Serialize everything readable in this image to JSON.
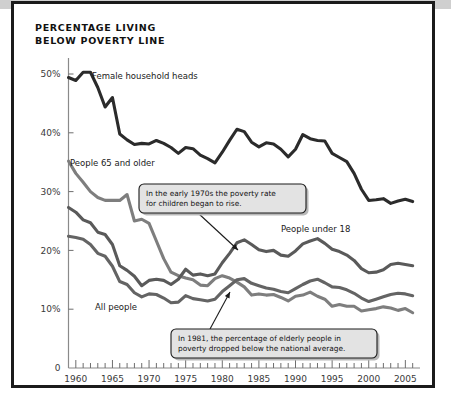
{
  "page": {
    "title_line1": "PERCENTAGE LIVING",
    "title_line2": "BELOW POVERTY LINE",
    "title": "PERCENTAGE LIVING\nBELOW POVERTY LINE",
    "frame_color": "#1b1b1b",
    "background": "#ffffff"
  },
  "chart_data": {
    "type": "line",
    "title": "PERCENTAGE LIVING BELOW POVERTY LINE",
    "xlabel": "",
    "ylabel": "",
    "xlim": [
      1959,
      2007
    ],
    "ylim": [
      0,
      53
    ],
    "grid": false,
    "legend": "inline-labels",
    "ytick_labels": [
      "0",
      "10%",
      "20%",
      "30%",
      "40%",
      "50%"
    ],
    "ytick_values": [
      0,
      10,
      20,
      30,
      40,
      50
    ],
    "xtick_labels": [
      "1960",
      "1965",
      "1970",
      "1975",
      "1980",
      "1985",
      "1990",
      "1995",
      "2000",
      "2005"
    ],
    "xtick_values": [
      1960,
      1965,
      1970,
      1975,
      1980,
      1985,
      1990,
      1995,
      2000,
      2005
    ],
    "xtick_minor_step": 1,
    "x": [
      1959,
      1960,
      1961,
      1962,
      1963,
      1964,
      1965,
      1966,
      1967,
      1968,
      1969,
      1970,
      1971,
      1972,
      1973,
      1974,
      1975,
      1976,
      1977,
      1978,
      1979,
      1980,
      1981,
      1982,
      1983,
      1984,
      1985,
      1986,
      1987,
      1988,
      1989,
      1990,
      1991,
      1992,
      1993,
      1994,
      1995,
      1996,
      1997,
      1998,
      1999,
      2000,
      2001,
      2002,
      2003,
      2004,
      2005,
      2006
    ],
    "series": [
      {
        "name": "Female household heads",
        "label": "Female household heads",
        "color": "#2b2b2b",
        "width": 3.1,
        "values": [
          49.4,
          48.9,
          50.3,
          50.3,
          47.7,
          44.4,
          46.0,
          39.8,
          38.8,
          38.0,
          38.2,
          38.1,
          38.7,
          38.2,
          37.5,
          36.5,
          37.5,
          37.3,
          36.2,
          35.6,
          34.9,
          36.7,
          38.7,
          40.6,
          40.2,
          38.4,
          37.6,
          38.3,
          38.1,
          37.2,
          35.9,
          37.2,
          39.7,
          39.0,
          38.7,
          38.6,
          36.5,
          35.8,
          35.1,
          33.1,
          30.4,
          28.5,
          28.6,
          28.8,
          28.0,
          28.4,
          28.7,
          28.3
        ]
      },
      {
        "name": "People 65 and older",
        "label": "People 65 and older",
        "color": "#7e7e7e",
        "width": 3.1,
        "values": [
          35.2,
          33.1,
          31.6,
          30.0,
          29.0,
          28.5,
          28.5,
          28.5,
          29.5,
          25.0,
          25.3,
          24.6,
          21.6,
          18.6,
          16.3,
          15.7,
          15.3,
          15.0,
          14.1,
          14.0,
          15.2,
          15.7,
          15.3,
          14.6,
          13.8,
          12.4,
          12.6,
          12.4,
          12.5,
          12.0,
          11.4,
          12.2,
          12.4,
          12.9,
          12.2,
          11.7,
          10.5,
          10.8,
          10.5,
          10.5,
          9.7,
          9.9,
          10.1,
          10.4,
          10.2,
          9.8,
          10.1,
          9.4
        ]
      },
      {
        "name": "People under 18",
        "label": "People under 18",
        "color": "#5a5a5a",
        "width": 3.1,
        "values": [
          27.3,
          26.5,
          25.2,
          24.7,
          23.1,
          22.7,
          21.0,
          17.4,
          16.6,
          15.6,
          14.0,
          14.9,
          15.1,
          14.9,
          14.2,
          15.1,
          16.8,
          15.8,
          16.0,
          15.7,
          16.0,
          17.9,
          19.5,
          21.3,
          21.8,
          21.0,
          20.1,
          19.8,
          20.0,
          19.2,
          19.0,
          19.9,
          21.1,
          21.6,
          22.0,
          21.2,
          20.2,
          19.8,
          19.2,
          18.3,
          16.9,
          16.2,
          16.3,
          16.7,
          17.6,
          17.8,
          17.6,
          17.4
        ]
      },
      {
        "name": "All people",
        "label": "All people",
        "color": "#646464",
        "width": 3.1,
        "values": [
          22.4,
          22.2,
          21.9,
          21.0,
          19.5,
          19.0,
          17.3,
          14.7,
          14.2,
          12.8,
          12.1,
          12.6,
          12.5,
          11.9,
          11.1,
          11.2,
          12.3,
          11.8,
          11.6,
          11.4,
          11.7,
          13.0,
          14.0,
          15.0,
          15.2,
          14.4,
          14.0,
          13.6,
          13.4,
          13.0,
          12.8,
          13.5,
          14.2,
          14.8,
          15.1,
          14.5,
          13.8,
          13.7,
          13.3,
          12.7,
          11.9,
          11.3,
          11.7,
          12.1,
          12.5,
          12.7,
          12.6,
          12.3
        ]
      }
    ],
    "annotations": [
      {
        "id": "children-rise",
        "text_line1": "In the early 1970s the poverty rate",
        "text_line2": "for children began to rise.",
        "points_to_year": 1978,
        "points_to_value": 16.5
      },
      {
        "id": "elderly-below-average",
        "text_line1": "In 1981, the percentage of elderly people in",
        "text_line2": "poverty dropped below the national average.",
        "points_to_year": 1982,
        "points_to_value": 15.0
      }
    ]
  }
}
